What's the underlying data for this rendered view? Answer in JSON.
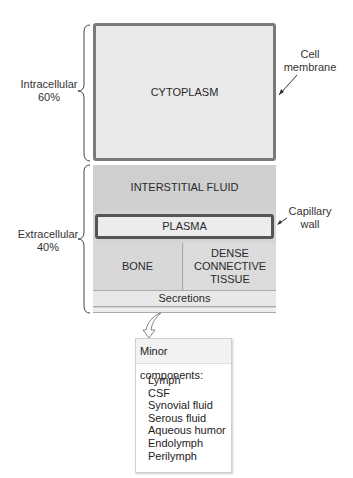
{
  "diagram": {
    "intracellular": {
      "label": "Intracellular",
      "percent": "60%"
    },
    "extracellular": {
      "label": "Extracellular",
      "percent": "40%"
    },
    "compartments": {
      "cytoplasm": "CYTOPLASM",
      "interstitial": "INTERSTITIAL FLUID",
      "plasma": "PLASMA",
      "bone": "BONE",
      "dense_line1": "DENSE",
      "dense_line2": "CONNECTIVE",
      "dense_line3": "TISSUE",
      "secretions": "Secretions"
    },
    "annotations": {
      "cell_membrane_line1": "Cell",
      "cell_membrane_line2": "membrane",
      "capillary_line1": "Capillary",
      "capillary_line2": "wall"
    },
    "minor": {
      "title": "Minor components:",
      "items": [
        "Lymph",
        "CSF",
        "Synovial fluid",
        "Serous fluid",
        "Aqueous humor",
        "Endolymph",
        "Perilymph"
      ]
    },
    "colors": {
      "cytoplasm": "#e9e9e9",
      "interstitial": "#cfcfcf",
      "plasma": "#ececec",
      "border": "#555555"
    }
  }
}
